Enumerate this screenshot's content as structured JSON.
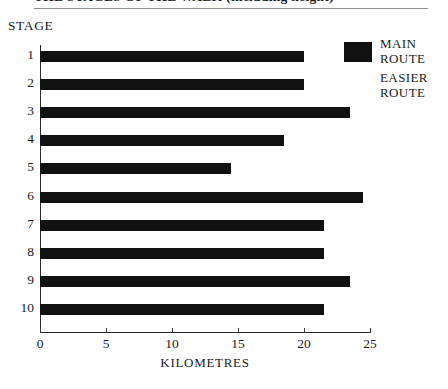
{
  "title": "THE STAGES OF THE WALK (including height)",
  "axis_titles": {
    "y": "STAGE",
    "x": "KILOMETRES"
  },
  "legend": {
    "items": [
      {
        "label": "MAIN\nROUTE",
        "swatch": "filled",
        "color": "#111111"
      },
      {
        "label": "EASIER\nROUTE",
        "swatch": "empty",
        "color": "#ffffff"
      }
    ]
  },
  "colors": {
    "bar": "#111111",
    "axis": "#2a2a2a",
    "text": "#1b1b1b",
    "background": "#ffffff"
  },
  "chart_data": {
    "type": "bar",
    "orientation": "horizontal",
    "title": "THE STAGES OF THE WALK (including height)",
    "xlabel": "KILOMETRES",
    "ylabel": "STAGE",
    "xlim": [
      0,
      25
    ],
    "xticks": [
      0,
      5,
      10,
      15,
      20,
      25
    ],
    "grid": false,
    "legend_position": "top-right",
    "categories": [
      "1",
      "2",
      "3",
      "4",
      "5",
      "6",
      "7",
      "8",
      "9",
      "10"
    ],
    "series": [
      {
        "name": "MAIN ROUTE",
        "color": "#111111",
        "values": [
          20,
          20,
          23.5,
          18.5,
          14.5,
          24.5,
          21.5,
          21.5,
          23.5,
          21.5
        ]
      }
    ]
  }
}
